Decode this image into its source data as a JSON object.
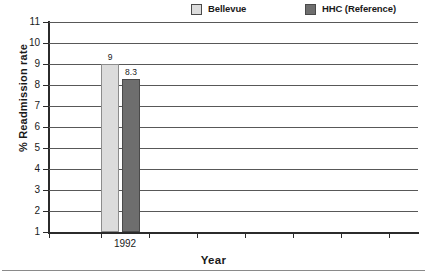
{
  "chart_data": {
    "type": "bar",
    "title": "",
    "subtitle": "",
    "xlabel": "Year",
    "ylabel": "% Readmission rate",
    "categories": [
      "1992"
    ],
    "series": [
      {
        "name": "Bellevue",
        "values": [
          9
        ],
        "value_labels": [
          "9"
        ],
        "color": "#dcdcdc"
      },
      {
        "name": "HHC (Reference)",
        "values": [
          8.3
        ],
        "value_labels": [
          "8.3"
        ],
        "color": "#6e6e6e"
      }
    ],
    "ylim": [
      1,
      11
    ],
    "ytick_labels": [
      "11",
      "10",
      "9",
      "8",
      "7",
      "6",
      "5",
      "4",
      "3",
      "2",
      "1"
    ],
    "ytick_values": [
      11,
      10,
      9,
      8,
      7,
      6,
      5,
      4,
      3,
      2,
      1
    ],
    "xtick_labels": [
      "1992"
    ],
    "grid": true,
    "grid_axis": "y",
    "legend_position": "top"
  },
  "legend": {
    "entries": [
      {
        "label": "Bellevue",
        "color": "#dcdcdc"
      },
      {
        "label": "HHC (Reference)",
        "color": "#6e6e6e"
      }
    ]
  },
  "axes": {
    "y_title": "% Readmission rate",
    "x_title": "Year",
    "y_labels": [
      "11",
      "10",
      "9",
      "8",
      "7",
      "6",
      "5",
      "4",
      "3",
      "2",
      "1"
    ],
    "x_labels": [
      "1992"
    ]
  },
  "bars": [
    {
      "series": "Bellevue",
      "category": "1992",
      "value": 9,
      "label": "9"
    },
    {
      "series": "HHC (Reference)",
      "category": "1992",
      "value": 8.3,
      "label": "8.3"
    }
  ]
}
